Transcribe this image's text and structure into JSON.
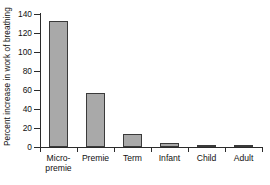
{
  "chart_data": {
    "type": "bar",
    "title": "",
    "xlabel": "",
    "ylabel": "Percent increase in work of breathing",
    "categories": [
      "Micro-\npremie",
      "Premie",
      "Term",
      "Infant",
      "Child",
      "Adult"
    ],
    "categories_flat": [
      "Micro-premie",
      "Premie",
      "Term",
      "Infant",
      "Child",
      "Adult"
    ],
    "values": [
      133,
      57,
      14,
      4,
      2,
      1
    ],
    "ylim": [
      0,
      140
    ],
    "yticks": [
      0,
      20,
      40,
      60,
      80,
      100,
      120,
      140
    ],
    "ytick_labels": [
      "0",
      "20",
      "40",
      "60",
      "80",
      "100",
      "120",
      "140"
    ],
    "grid": false,
    "legend": false,
    "bar_fill_color": "#a9a9a9",
    "bar_edge_color": "#3a3a3a",
    "axis_color": "#2b2b2b",
    "background_color": "#ffffff"
  }
}
